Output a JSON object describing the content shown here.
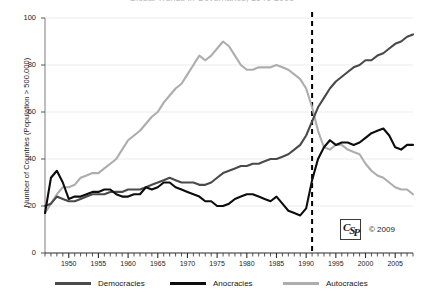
{
  "figure": {
    "title_sliver": "Global Trends in Governance, 1946-2008",
    "copyright": "© 2009",
    "logo_letters": {
      "first": "C",
      "mid": "S",
      "last": "P"
    }
  },
  "axes": {
    "ylabel": "Number of Countries (Population > 500,000)",
    "yticks": [
      "0",
      "20",
      "40",
      "60",
      "80",
      "100"
    ],
    "xticks": [
      "1950",
      "1955",
      "1960",
      "1965",
      "1970",
      "1975",
      "1980",
      "1985",
      "1990",
      "1995",
      "2000",
      "2005"
    ]
  },
  "legend": {
    "items": [
      {
        "label": "Democracies",
        "color": "#4a4a4a"
      },
      {
        "label": "Anocracies",
        "color": "#0d0d0d"
      },
      {
        "label": "Autocracies",
        "color": "#adadad"
      }
    ]
  },
  "annotation": {
    "vline_year": 1991,
    "vline_style": "dashed"
  },
  "chart_data": {
    "type": "line",
    "title": "Global Trends in Governance, 1946-2008",
    "xlabel": "",
    "ylabel": "Number of Countries (Population > 500,000)",
    "xlim": [
      1946,
      2008
    ],
    "ylim": [
      0,
      100
    ],
    "grid": true,
    "legend_position": "bottom",
    "annotations": [
      {
        "type": "vline",
        "x": 1991,
        "style": "dashed",
        "color": "#000000"
      }
    ],
    "x": [
      1946,
      1947,
      1948,
      1949,
      1950,
      1951,
      1952,
      1953,
      1954,
      1955,
      1956,
      1957,
      1958,
      1959,
      1960,
      1961,
      1962,
      1963,
      1964,
      1965,
      1966,
      1967,
      1968,
      1969,
      1970,
      1971,
      1972,
      1973,
      1974,
      1975,
      1976,
      1977,
      1978,
      1979,
      1980,
      1981,
      1982,
      1983,
      1984,
      1985,
      1986,
      1987,
      1988,
      1989,
      1990,
      1991,
      1992,
      1993,
      1994,
      1995,
      1996,
      1997,
      1998,
      1999,
      2000,
      2001,
      2002,
      2003,
      2004,
      2005,
      2006,
      2007,
      2008
    ],
    "series": [
      {
        "name": "Democracies",
        "color": "#4a4a4a",
        "values": [
          20,
          21,
          24,
          23,
          22,
          22,
          23,
          24,
          25,
          25,
          25,
          26,
          26,
          26,
          27,
          27,
          27,
          28,
          29,
          30,
          31,
          32,
          31,
          30,
          30,
          30,
          29,
          29,
          30,
          32,
          34,
          35,
          36,
          37,
          37,
          38,
          38,
          39,
          40,
          40,
          41,
          42,
          44,
          46,
          50,
          56,
          62,
          66,
          70,
          73,
          75,
          77,
          79,
          80,
          82,
          82,
          84,
          85,
          87,
          89,
          90,
          92,
          93
        ]
      },
      {
        "name": "Anocracies",
        "color": "#0d0d0d",
        "values": [
          17,
          32,
          35,
          30,
          23,
          24,
          24,
          25,
          26,
          26,
          27,
          27,
          25,
          24,
          24,
          25,
          25,
          28,
          27,
          28,
          30,
          30,
          28,
          27,
          26,
          25,
          24,
          22,
          22,
          20,
          20,
          21,
          23,
          24,
          25,
          25,
          24,
          23,
          22,
          24,
          21,
          18,
          17,
          16,
          19,
          31,
          40,
          45,
          48,
          46,
          47,
          47,
          46,
          47,
          49,
          51,
          52,
          53,
          50,
          45,
          44,
          46,
          46
        ]
      },
      {
        "name": "Autocracies",
        "color": "#adadad",
        "values": [
          17,
          21,
          25,
          28,
          28,
          29,
          32,
          33,
          34,
          34,
          36,
          38,
          40,
          44,
          48,
          50,
          52,
          55,
          58,
          60,
          64,
          67,
          70,
          72,
          76,
          80,
          84,
          82,
          84,
          87,
          90,
          88,
          84,
          80,
          78,
          78,
          79,
          79,
          79,
          80,
          79,
          78,
          76,
          74,
          70,
          62,
          52,
          45,
          44,
          46,
          46,
          44,
          43,
          42,
          38,
          35,
          33,
          32,
          30,
          28,
          27,
          27,
          25
        ]
      }
    ]
  }
}
